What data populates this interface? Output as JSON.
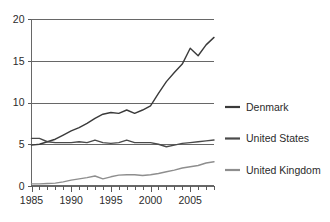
{
  "chart_data": {
    "type": "line",
    "title": "",
    "subtitle": "",
    "xlabel": "",
    "ylabel": "",
    "xlim": [
      1985,
      2008
    ],
    "ylim": [
      0,
      20
    ],
    "yticks": [
      0,
      5,
      10,
      15,
      20
    ],
    "ytick_labels": [
      "0",
      "5",
      "10",
      "15",
      "20"
    ],
    "xticks": [
      1985,
      1990,
      1995,
      2000,
      2005
    ],
    "xtick_labels": [
      "1985",
      "1990",
      "1995",
      "2000",
      "2005"
    ],
    "minor_xticks_every": 1,
    "grid": "horizontal",
    "legend_position": "right",
    "x": [
      1985,
      1986,
      1987,
      1988,
      1989,
      1990,
      1991,
      1992,
      1993,
      1994,
      1995,
      1996,
      1997,
      1998,
      1999,
      2000,
      2001,
      2002,
      2003,
      2004,
      2005,
      2006,
      2007,
      2008
    ],
    "series": [
      {
        "name": "Denmark",
        "color": "#3a3a3a",
        "values": [
          4.9,
          5.0,
          5.3,
          5.6,
          6.1,
          6.6,
          7.0,
          7.5,
          8.1,
          8.6,
          8.8,
          8.7,
          9.1,
          8.7,
          9.1,
          9.6,
          11.1,
          12.5,
          13.6,
          14.6,
          16.5,
          15.6,
          16.9,
          17.8
        ]
      },
      {
        "name": "United States",
        "color": "#4a4a4a",
        "values": [
          5.7,
          5.7,
          5.3,
          5.2,
          5.2,
          5.2,
          5.3,
          5.2,
          5.5,
          5.2,
          5.1,
          5.2,
          5.5,
          5.2,
          5.2,
          5.2,
          5.0,
          4.7,
          4.9,
          5.1,
          5.2,
          5.3,
          5.4,
          5.5
        ]
      },
      {
        "name": "United Kingdom",
        "color": "#8e8e8e",
        "values": [
          0.25,
          0.25,
          0.3,
          0.35,
          0.5,
          0.7,
          0.85,
          1.0,
          1.2,
          0.85,
          1.1,
          1.3,
          1.35,
          1.35,
          1.25,
          1.35,
          1.5,
          1.7,
          1.9,
          2.15,
          2.3,
          2.45,
          2.75,
          2.9
        ]
      }
    ],
    "legend": [
      {
        "label": "Denmark",
        "color": "#3a3a3a"
      },
      {
        "label": "United States",
        "color": "#4a4a4a"
      },
      {
        "label": "United Kingdom",
        "color": "#8e8e8e"
      }
    ]
  },
  "colors": {
    "background": "#ffffff",
    "axis": "#676767",
    "grid": "#676767",
    "text": "#2b2b2b",
    "denmark": "#3a3a3a",
    "united_states": "#4a4a4a",
    "united_kingdom": "#8e8e8e"
  }
}
